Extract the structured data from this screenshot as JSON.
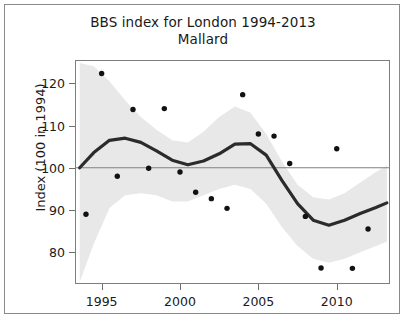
{
  "figure": {
    "title": "BBS index for London 1994-2013",
    "subtitle": "Mallard",
    "ylabel": "Index (100 in 1994)",
    "xlabel": ""
  },
  "chart_data": {
    "type": "line",
    "title": "BBS index for London 1994-2013",
    "subtitle": "Mallard",
    "xlabel": "",
    "ylabel": "Index (100 in 1994)",
    "xlim": [
      1993.3,
      2013.4
    ],
    "ylim": [
      72.5,
      125.5
    ],
    "xticks": [
      1995,
      2000,
      2005,
      2010
    ],
    "xticklabels": [
      "1995",
      "2000",
      "2005",
      "2010"
    ],
    "yticks": [
      80,
      90,
      100,
      110,
      120
    ],
    "yticklabels": [
      "80",
      "90",
      "100",
      "110",
      "120"
    ],
    "grid": false,
    "legend": null,
    "reference_line": {
      "y": 100,
      "color": "#808080",
      "label": "baseline 100"
    },
    "series": [
      {
        "name": "Annual index (observed)",
        "type": "scatter",
        "marker": "filled-circle",
        "color": "#111111",
        "x": [
          1994,
          1995,
          1996,
          1997,
          1998,
          1999,
          2000,
          2001,
          2002,
          2003,
          2004,
          2005,
          2006,
          2007,
          2008,
          2009,
          2010,
          2011,
          2012
        ],
        "y": [
          89.0,
          122.3,
          98.0,
          113.8,
          99.9,
          114.0,
          99.0,
          94.2,
          92.7,
          90.4,
          117.3,
          108.0,
          107.5,
          101.0,
          88.5,
          76.3,
          104.5,
          76.2,
          85.5
        ]
      },
      {
        "name": "Smoothed trend",
        "type": "line",
        "color": "#2b2b2b",
        "linewidth": 3.2,
        "x": [
          1993.6,
          1994.5,
          1995.5,
          1996.5,
          1997.5,
          1998.5,
          1999.5,
          2000.5,
          2001.5,
          2002.5,
          2003.5,
          2004.5,
          2005.5,
          2006.5,
          2007.5,
          2008.5,
          2009.5,
          2010.5,
          2011.5,
          2012.5,
          2013.2
        ],
        "y": [
          100.0,
          103.6,
          106.5,
          107.0,
          106.0,
          104.0,
          101.8,
          100.7,
          101.6,
          103.3,
          105.6,
          105.7,
          103.0,
          97.0,
          91.5,
          87.6,
          86.4,
          87.6,
          89.2,
          90.6,
          91.7
        ]
      },
      {
        "name": "Confidence band (upper)",
        "type": "band-edge",
        "color": "#e8e8e8",
        "x": [
          1993.6,
          1994.5,
          1995.5,
          1996.5,
          1997.5,
          1998.5,
          1999.5,
          2000.5,
          2001.5,
          2002.5,
          2003.5,
          2004.5,
          2005.5,
          2006.5,
          2007.5,
          2008.5,
          2009.5,
          2010.5,
          2011.5,
          2012.5,
          2013.2
        ],
        "y": [
          124.8,
          124.0,
          120.5,
          116.0,
          112.0,
          109.0,
          106.5,
          106.0,
          108.5,
          112.0,
          114.5,
          113.0,
          108.0,
          101.5,
          96.0,
          93.0,
          92.5,
          94.0,
          96.5,
          99.0,
          100.5
        ]
      },
      {
        "name": "Confidence band (lower)",
        "type": "band-edge",
        "color": "#e8e8e8",
        "x": [
          1993.6,
          1994.5,
          1995.5,
          1996.5,
          1997.5,
          1998.5,
          1999.5,
          2000.5,
          2001.5,
          2002.5,
          2003.5,
          2004.5,
          2005.5,
          2006.5,
          2007.5,
          2008.5,
          2009.5,
          2010.5,
          2011.5,
          2012.5,
          2013.2
        ],
        "y": [
          73.0,
          82.0,
          90.5,
          93.5,
          94.0,
          93.5,
          92.0,
          92.0,
          93.5,
          95.0,
          96.0,
          95.0,
          91.5,
          86.0,
          81.5,
          78.5,
          77.5,
          78.5,
          80.0,
          81.5,
          82.5
        ]
      }
    ]
  },
  "colors": {
    "trend_line": "#2b2b2b",
    "points": "#111111",
    "band": "#e8e8e8",
    "reference": "#808080",
    "frame": "#7d7d7d"
  }
}
